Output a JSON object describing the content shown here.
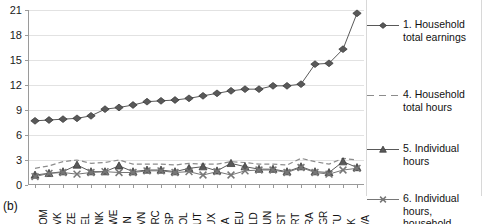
{
  "panel": {
    "label": "(b)"
  },
  "chart_data": {
    "type": "line",
    "title": "",
    "xlabel": "",
    "ylabel": "",
    "ylim": [
      0,
      21
    ],
    "yticks": [
      0,
      3,
      6,
      9,
      12,
      15,
      18,
      21
    ],
    "grid": true,
    "legend_position": "right",
    "categories": [
      "ROM",
      "SVK",
      "CZE",
      "BEL",
      "DNK",
      "SWE",
      "FIN",
      "SVN",
      "GRC",
      "ESP",
      "POL",
      "AUT",
      "LUX",
      "ITA",
      "DEU",
      "NLD",
      "HUN",
      "EST",
      "PRT",
      "FRA",
      "BGR",
      "LTU",
      "UK",
      "LVA"
    ],
    "series": [
      {
        "name": "1. Household total earnings",
        "marker": "diamond",
        "linestyle": "solid",
        "color": "#595959",
        "values": [
          7.7,
          7.8,
          7.9,
          8.0,
          8.3,
          9.1,
          9.3,
          9.6,
          10.0,
          10.1,
          10.2,
          10.4,
          10.7,
          11.0,
          11.3,
          11.5,
          11.5,
          11.9,
          11.9,
          12.1,
          14.5,
          14.6,
          16.3,
          20.6
        ]
      },
      {
        "name": "4. Household total hours",
        "marker": "none",
        "linestyle": "dashed",
        "color": "#8c8c8c",
        "values": [
          2.0,
          2.3,
          2.8,
          3.0,
          2.6,
          2.7,
          3.0,
          2.5,
          2.5,
          2.5,
          2.4,
          2.6,
          2.5,
          2.5,
          2.8,
          2.7,
          2.5,
          2.5,
          2.4,
          3.2,
          2.8,
          2.5,
          3.2,
          3.0
        ]
      },
      {
        "name": "5. Individual hours",
        "marker": "triangle",
        "linestyle": "solid",
        "color": "#595959",
        "values": [
          1.2,
          1.4,
          1.6,
          2.4,
          1.6,
          1.6,
          2.3,
          1.6,
          1.8,
          1.8,
          1.6,
          2.0,
          2.2,
          1.7,
          2.6,
          2.2,
          1.9,
          1.9,
          1.6,
          2.2,
          1.6,
          1.5,
          2.8,
          2.1
        ]
      },
      {
        "name": "6. Individual hours, household ranked",
        "marker": "x",
        "linestyle": "solid",
        "color": "#777777",
        "values": [
          1.0,
          1.4,
          1.5,
          1.3,
          1.5,
          1.6,
          1.5,
          1.5,
          1.7,
          1.7,
          1.5,
          1.6,
          1.2,
          1.6,
          1.2,
          1.7,
          1.8,
          1.8,
          1.5,
          2.1,
          1.5,
          1.3,
          1.8,
          2.0
        ]
      }
    ]
  },
  "legend": {
    "items": [
      {
        "label": "1. Household total earnings",
        "marker": "diamond-marker",
        "linestyle": "solid"
      },
      {
        "label": "4. Household total hours",
        "marker": "no-marker",
        "linestyle": "dashed"
      },
      {
        "label": "5. Individual hours",
        "marker": "triangle-marker",
        "linestyle": "solid"
      },
      {
        "label": "6. Individual hours, household ranked",
        "marker": "x-marker",
        "linestyle": "solid"
      }
    ]
  }
}
